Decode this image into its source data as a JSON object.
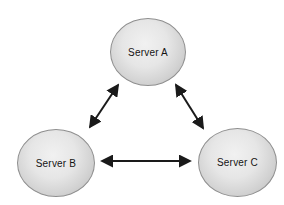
{
  "diagram": {
    "background_color": "#ffffff",
    "node_border_color": "#8f8f8f",
    "node_fill_highlight": "#f1f1f1",
    "node_fill_edge": "#b4b4b4",
    "arrow_color": "#1a1a1a",
    "nodes": [
      {
        "id": "server-a",
        "label": "Server A",
        "position": "top-center"
      },
      {
        "id": "server-b",
        "label": "Server B",
        "position": "bottom-left"
      },
      {
        "id": "server-c",
        "label": "Server C",
        "position": "bottom-right"
      }
    ],
    "edges": [
      {
        "from": "Server A",
        "to": "Server B",
        "bidirectional": true
      },
      {
        "from": "Server A",
        "to": "Server C",
        "bidirectional": true
      },
      {
        "from": "Server B",
        "to": "Server C",
        "bidirectional": true
      }
    ]
  }
}
